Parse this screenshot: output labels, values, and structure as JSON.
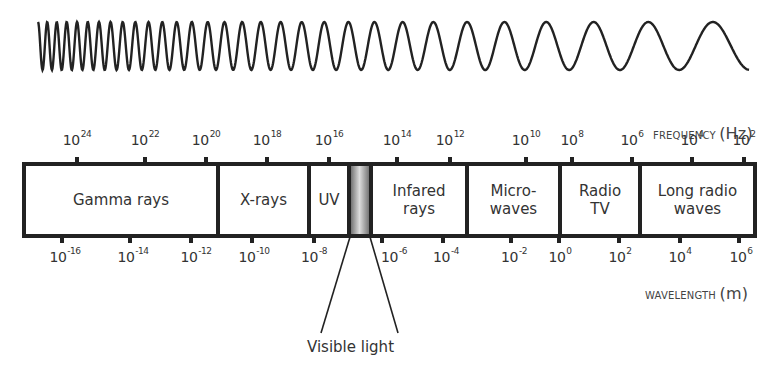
{
  "diagram": {
    "frequency_axis": {
      "title": "FREQUENCY",
      "unit": "(Hz)",
      "ticks": [
        {
          "base": "10",
          "exp": "24"
        },
        {
          "base": "10",
          "exp": "22"
        },
        {
          "base": "10",
          "exp": "20"
        },
        {
          "base": "10",
          "exp": "18"
        },
        {
          "base": "10",
          "exp": "16"
        },
        {
          "base": "10",
          "exp": "14"
        },
        {
          "base": "10",
          "exp": "12"
        },
        {
          "base": "10",
          "exp": "10"
        },
        {
          "base": "10",
          "exp": "8"
        },
        {
          "base": "10",
          "exp": "6"
        },
        {
          "base": "10",
          "exp": "4"
        },
        {
          "base": "10",
          "exp": "2"
        }
      ]
    },
    "wavelength_axis": {
      "title": "WAVELENGTH",
      "unit": "(m)",
      "ticks": [
        {
          "base": "10",
          "exp": "-16"
        },
        {
          "base": "10",
          "exp": "-14"
        },
        {
          "base": "10",
          "exp": "-12"
        },
        {
          "base": "10",
          "exp": "-10"
        },
        {
          "base": "10",
          "exp": "-8"
        },
        {
          "base": "10",
          "exp": "-6"
        },
        {
          "base": "10",
          "exp": "-4"
        },
        {
          "base": "10",
          "exp": "-2"
        },
        {
          "base": "10",
          "exp": "0"
        },
        {
          "base": "10",
          "exp": "2"
        },
        {
          "base": "10",
          "exp": "4"
        },
        {
          "base": "10",
          "exp": "6"
        }
      ]
    },
    "bands": [
      {
        "line1": "Gamma rays",
        "line2": ""
      },
      {
        "line1": "X-rays",
        "line2": ""
      },
      {
        "line1": "UV",
        "line2": ""
      },
      {
        "line1": "Infared",
        "line2": "rays"
      },
      {
        "line1": "Micro-",
        "line2": "waves"
      },
      {
        "line1": "Radio",
        "line2": "TV"
      },
      {
        "line1": "Long radio",
        "line2": "waves"
      }
    ],
    "visible_light_label": "Visible light",
    "colors": {
      "line": "#222222",
      "text": "#333333",
      "visible_gradient_dark": "#555555",
      "visible_gradient_light": "#e0e0e0"
    }
  }
}
